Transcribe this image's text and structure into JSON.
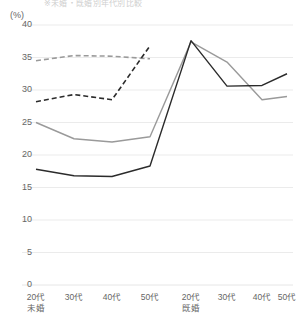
{
  "title_clipped": "※未婚・既婚別年代別比較",
  "axis": {
    "unit_label": "(%)",
    "y_ticks": [
      "40",
      "35",
      "30",
      "25",
      "20",
      "15",
      "10",
      "5",
      "0"
    ]
  },
  "groups": [
    {
      "sub_label": "未婚",
      "categories": [
        "20代",
        "30代",
        "40代",
        "50代"
      ]
    },
    {
      "sub_label": "既婚",
      "categories": [
        "20代",
        "30代",
        "40代",
        "50代"
      ]
    }
  ],
  "colors": {
    "black": "#2b2b2b",
    "gray": "#9a9a9a",
    "gridline": "#e6e6e6",
    "axis_text": "#666666",
    "background": "#ffffff"
  },
  "chart_data": {
    "type": "line",
    "title": "",
    "xlabel": "",
    "ylabel": "(%)",
    "ylim": [
      0,
      40
    ],
    "ytick_step": 5,
    "grid": true,
    "legend": "none",
    "categories": [
      "20代 未婚",
      "30代 未婚",
      "40代 未婚",
      "50代 未婚",
      "20代 既婚",
      "30代 既婚",
      "40代 既婚",
      "50代 既婚"
    ],
    "series": [
      {
        "name": "series-gray-dashed",
        "color": "#9a9a9a",
        "style": "dashed",
        "values": [
          34.5,
          35.3,
          35.2,
          34.8,
          null,
          null,
          null,
          null
        ]
      },
      {
        "name": "series-black-dashed",
        "color": "#2b2b2b",
        "style": "dashed",
        "values": [
          28.2,
          29.3,
          28.5,
          36.8,
          null,
          null,
          null,
          null
        ]
      },
      {
        "name": "series-gray-solid",
        "color": "#9a9a9a",
        "style": "solid",
        "values": [
          25.0,
          22.5,
          22.0,
          22.8,
          37.4,
          34.3,
          28.5,
          29.0
        ]
      },
      {
        "name": "series-black-solid",
        "color": "#2b2b2b",
        "style": "solid",
        "values": [
          17.8,
          16.8,
          16.7,
          18.3,
          37.6,
          30.6,
          30.7,
          32.5
        ]
      }
    ]
  }
}
